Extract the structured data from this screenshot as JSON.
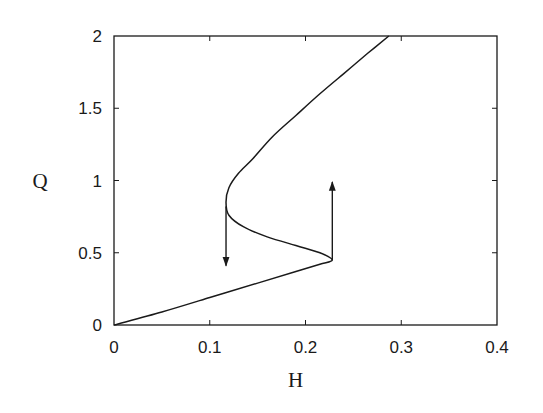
{
  "chart_data": {
    "type": "line",
    "title": "",
    "xlabel": "H",
    "ylabel": "Q",
    "xlim": [
      0,
      0.4
    ],
    "ylim": [
      0,
      2
    ],
    "xticks": [
      0,
      0.1,
      0.2,
      0.3,
      0.4
    ],
    "yticks": [
      0,
      0.5,
      1,
      1.5,
      2
    ],
    "xtick_labels": [
      "0",
      "0.1",
      "0.2",
      "0.3",
      "0.4"
    ],
    "ytick_labels": [
      "0",
      "0.5",
      "1",
      "1.5",
      "2"
    ],
    "grid": false,
    "legend": null,
    "series": [
      {
        "name": "S-curve",
        "points": [
          [
            0.0,
            0.0
          ],
          [
            0.05,
            0.09
          ],
          [
            0.1,
            0.19
          ],
          [
            0.15,
            0.29
          ],
          [
            0.19,
            0.37
          ],
          [
            0.215,
            0.42
          ],
          [
            0.228,
            0.45
          ],
          [
            0.215,
            0.5
          ],
          [
            0.19,
            0.55
          ],
          [
            0.16,
            0.61
          ],
          [
            0.135,
            0.68
          ],
          [
            0.12,
            0.76
          ],
          [
            0.117,
            0.85
          ],
          [
            0.12,
            0.95
          ],
          [
            0.13,
            1.05
          ],
          [
            0.145,
            1.15
          ],
          [
            0.165,
            1.3
          ],
          [
            0.19,
            1.45
          ],
          [
            0.215,
            1.6
          ],
          [
            0.24,
            1.74
          ],
          [
            0.265,
            1.88
          ],
          [
            0.287,
            2.0
          ]
        ]
      }
    ],
    "annotations": [
      {
        "type": "arrow",
        "name": "jump-down",
        "from": [
          0.117,
          0.82
        ],
        "to": [
          0.117,
          0.41
        ]
      },
      {
        "type": "arrow",
        "name": "jump-up",
        "from": [
          0.228,
          0.45
        ],
        "to": [
          0.228,
          0.99
        ]
      }
    ]
  }
}
